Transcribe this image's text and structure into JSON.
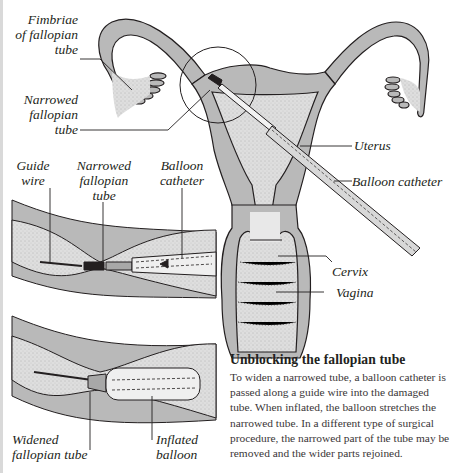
{
  "diagram": {
    "labels": {
      "fimbriae": "Fimbriae\nof fallopian\ntube",
      "fimbriae_lines": [
        "Fimbriae",
        "of fallopian",
        "tube"
      ],
      "narrowed_main": [
        "Narrowed",
        "fallopian",
        "tube"
      ],
      "uterus": "Uterus",
      "balloon_catheter_main": "Balloon catheter",
      "cervix": "Cervix",
      "vagina": "Vagina",
      "guide_wire": [
        "Guide",
        "wire"
      ],
      "narrowed_inset": [
        "Narrowed",
        "fallopian",
        "tube"
      ],
      "balloon_catheter_inset": [
        "Balloon",
        "catheter"
      ],
      "widened": [
        "Widened",
        "fallopian tube"
      ],
      "inflated": [
        "Inflated",
        "balloon"
      ]
    },
    "caption": {
      "title": "Unblocking the fallopian tube",
      "body": "To widen a narrowed tube, a balloon catheter is passed along a guide wire into the damaged tube. When inflated, the balloon stretches the narrowed tube. In a different type of surgical procedure, the narrowed part of the tube may be removed and the wider parts rejoined."
    },
    "colors": {
      "tissue": "#b9b9b9",
      "cavity": "#e4e4e4",
      "outline": "#231f20",
      "background": "#ffffff"
    }
  }
}
